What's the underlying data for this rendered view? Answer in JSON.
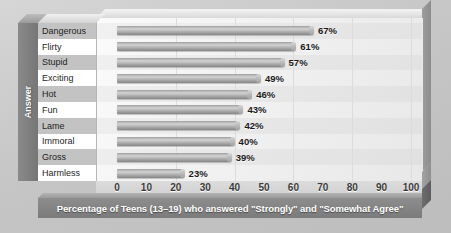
{
  "chart_data": {
    "type": "bar",
    "orientation": "horizontal",
    "title": "",
    "xlabel": "Percentage of Teens (13–19) who answered \"Strongly\" and \"Somewhat Agree\"",
    "ylabel": "Answer",
    "categories": [
      "Dangerous",
      "Flirty",
      "Stupid",
      "Exciting",
      "Hot",
      "Fun",
      "Lame",
      "Immoral",
      "Gross",
      "Harmless"
    ],
    "values": [
      67,
      61,
      57,
      49,
      46,
      43,
      42,
      40,
      39,
      23
    ],
    "value_labels": [
      "67%",
      "61%",
      "57%",
      "49%",
      "46%",
      "43%",
      "42%",
      "40%",
      "39%",
      "23%"
    ],
    "xlim": [
      0,
      100
    ],
    "xticks": [
      0,
      10,
      20,
      30,
      40,
      50,
      60,
      70,
      80,
      90,
      100
    ],
    "xtick_labels": [
      "0",
      "10",
      "20",
      "30",
      "40",
      "50",
      "60",
      "70",
      "80",
      "90",
      "100"
    ],
    "gridlines_x": [
      20,
      40,
      60,
      80,
      100
    ],
    "grid": true,
    "legend": null,
    "style": "3d-cylinder-bars",
    "colors": {
      "bar": "#b0b0b0",
      "plot_background": "#f4f4f4",
      "page_background": "#c9c9c9",
      "caption_background": "#828282",
      "caption_text": "#ffffff",
      "axis_block": "#7e7e7e",
      "row_band_even": "#c3c3c3",
      "row_band_odd": "#ffffff"
    }
  }
}
